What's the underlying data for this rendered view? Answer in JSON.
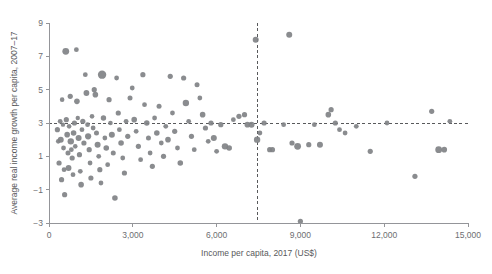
{
  "chart_data": {
    "type": "scatter",
    "title": "",
    "xlabel": "Income per capita, 2017 (US$)",
    "ylabel": "Average real income growth per capita, 2007–17",
    "xlim": [
      0,
      15000
    ],
    "ylim": [
      -3,
      9
    ],
    "xticks": [
      0,
      3000,
      6000,
      9000,
      12000,
      15000
    ],
    "xtick_labels": [
      "0",
      "3,000",
      "6,000",
      "9,000",
      "12,000",
      "15,000"
    ],
    "yticks": [
      -3,
      -1,
      1,
      3,
      5,
      7,
      9
    ],
    "ytick_labels": [
      "−3",
      "−1",
      "1",
      "3",
      "5",
      "7",
      "9"
    ],
    "grid": false,
    "legend": null,
    "point_color": "#808285",
    "reference_lines": [
      {
        "orientation": "horizontal",
        "value": 3,
        "style": "dashed",
        "color": "#58595b"
      },
      {
        "orientation": "vertical",
        "value": 7450,
        "style": "dashed",
        "color": "#58595b"
      }
    ],
    "marker_sizes_vary": true,
    "points": [
      {
        "x": 300,
        "y": 2.6,
        "r": 2.6
      },
      {
        "x": 330,
        "y": 1.9,
        "r": 2.3
      },
      {
        "x": 360,
        "y": 0.6,
        "r": 2.6
      },
      {
        "x": 400,
        "y": 3.1,
        "r": 2.4
      },
      {
        "x": 420,
        "y": 2.0,
        "r": 3.0
      },
      {
        "x": 450,
        "y": -0.4,
        "r": 2.6
      },
      {
        "x": 470,
        "y": 4.4,
        "r": 2.3
      },
      {
        "x": 500,
        "y": 2.9,
        "r": 2.2
      },
      {
        "x": 520,
        "y": 1.5,
        "r": 2.4
      },
      {
        "x": 540,
        "y": 0.2,
        "r": 2.4
      },
      {
        "x": 560,
        "y": -1.3,
        "r": 2.6
      },
      {
        "x": 600,
        "y": 7.3,
        "r": 3.4
      },
      {
        "x": 620,
        "y": 3.2,
        "r": 2.6
      },
      {
        "x": 650,
        "y": 2.3,
        "r": 2.8
      },
      {
        "x": 680,
        "y": 1.2,
        "r": 2.5
      },
      {
        "x": 700,
        "y": 0.3,
        "r": 2.9
      },
      {
        "x": 720,
        "y": 2.8,
        "r": 2.3
      },
      {
        "x": 760,
        "y": 4.6,
        "r": 2.6
      },
      {
        "x": 780,
        "y": 1.9,
        "r": 3.2
      },
      {
        "x": 800,
        "y": 1.4,
        "r": 2.4
      },
      {
        "x": 830,
        "y": 0.9,
        "r": 2.6
      },
      {
        "x": 860,
        "y": -0.1,
        "r": 2.4
      },
      {
        "x": 880,
        "y": 2.4,
        "r": 2.8
      },
      {
        "x": 910,
        "y": 3.0,
        "r": 2.6
      },
      {
        "x": 940,
        "y": 1.6,
        "r": 2.3
      },
      {
        "x": 980,
        "y": 7.4,
        "r": 2.4
      },
      {
        "x": 1000,
        "y": 4.3,
        "r": 2.8
      },
      {
        "x": 1030,
        "y": 3.3,
        "r": 2.2
      },
      {
        "x": 1060,
        "y": 2.1,
        "r": 3.0
      },
      {
        "x": 1090,
        "y": 1.1,
        "r": 2.6
      },
      {
        "x": 1120,
        "y": 0.1,
        "r": 2.4
      },
      {
        "x": 1150,
        "y": -0.7,
        "r": 2.8
      },
      {
        "x": 1180,
        "y": 2.6,
        "r": 2.4
      },
      {
        "x": 1210,
        "y": 3.1,
        "r": 2.6
      },
      {
        "x": 1250,
        "y": 1.8,
        "r": 2.6
      },
      {
        "x": 1300,
        "y": 5.9,
        "r": 2.4
      },
      {
        "x": 1340,
        "y": 4.8,
        "r": 2.9
      },
      {
        "x": 1380,
        "y": 2.9,
        "r": 2.4
      },
      {
        "x": 1400,
        "y": 2.2,
        "r": 3.1
      },
      {
        "x": 1440,
        "y": 1.4,
        "r": 2.6
      },
      {
        "x": 1470,
        "y": 0.6,
        "r": 2.4
      },
      {
        "x": 1500,
        "y": -0.3,
        "r": 2.6
      },
      {
        "x": 1540,
        "y": 3.4,
        "r": 2.3
      },
      {
        "x": 1580,
        "y": 2.7,
        "r": 2.4
      },
      {
        "x": 1620,
        "y": 5.0,
        "r": 2.6
      },
      {
        "x": 1660,
        "y": 4.7,
        "r": 2.8
      },
      {
        "x": 1700,
        "y": 2.4,
        "r": 2.5
      },
      {
        "x": 1740,
        "y": 1.7,
        "r": 3.0
      },
      {
        "x": 1780,
        "y": 1.0,
        "r": 2.4
      },
      {
        "x": 1820,
        "y": 0.2,
        "r": 2.6
      },
      {
        "x": 1860,
        "y": -0.6,
        "r": 2.4
      },
      {
        "x": 1900,
        "y": 5.9,
        "r": 4.2
      },
      {
        "x": 1950,
        "y": 3.3,
        "r": 2.7
      },
      {
        "x": 2000,
        "y": 2.1,
        "r": 2.4
      },
      {
        "x": 2050,
        "y": 1.5,
        "r": 2.8
      },
      {
        "x": 2100,
        "y": 0.5,
        "r": 2.4
      },
      {
        "x": 2150,
        "y": 4.4,
        "r": 2.6
      },
      {
        "x": 2200,
        "y": 3.0,
        "r": 2.3
      },
      {
        "x": 2250,
        "y": 2.3,
        "r": 3.0
      },
      {
        "x": 2300,
        "y": 1.2,
        "r": 2.5
      },
      {
        "x": 2360,
        "y": -1.5,
        "r": 2.8
      },
      {
        "x": 2420,
        "y": 5.7,
        "r": 2.4
      },
      {
        "x": 2480,
        "y": 3.6,
        "r": 2.6
      },
      {
        "x": 2520,
        "y": 2.6,
        "r": 2.4
      },
      {
        "x": 2580,
        "y": 1.8,
        "r": 2.8
      },
      {
        "x": 2640,
        "y": 0.9,
        "r": 2.4
      },
      {
        "x": 2700,
        "y": 0.0,
        "r": 2.6
      },
      {
        "x": 2760,
        "y": 3.1,
        "r": 2.4
      },
      {
        "x": 2820,
        "y": 2.2,
        "r": 2.6
      },
      {
        "x": 2900,
        "y": 4.5,
        "r": 2.5
      },
      {
        "x": 2980,
        "y": 5.1,
        "r": 2.4
      },
      {
        "x": 3050,
        "y": 3.2,
        "r": 2.8
      },
      {
        "x": 3120,
        "y": 2.5,
        "r": 2.4
      },
      {
        "x": 3200,
        "y": 1.6,
        "r": 2.6
      },
      {
        "x": 3280,
        "y": 0.8,
        "r": 2.4
      },
      {
        "x": 3360,
        "y": 5.9,
        "r": 2.6
      },
      {
        "x": 3420,
        "y": 4.1,
        "r": 2.4
      },
      {
        "x": 3500,
        "y": 3.0,
        "r": 2.8
      },
      {
        "x": 3560,
        "y": 2.1,
        "r": 2.5
      },
      {
        "x": 3620,
        "y": 1.2,
        "r": 2.4
      },
      {
        "x": 3700,
        "y": 0.4,
        "r": 2.6
      },
      {
        "x": 3780,
        "y": 3.3,
        "r": 2.4
      },
      {
        "x": 3860,
        "y": 2.4,
        "r": 2.8
      },
      {
        "x": 3940,
        "y": 4.0,
        "r": 2.5
      },
      {
        "x": 4020,
        "y": 1.8,
        "r": 2.4
      },
      {
        "x": 4100,
        "y": 1.0,
        "r": 2.6
      },
      {
        "x": 4180,
        "y": 2.8,
        "r": 2.4
      },
      {
        "x": 4260,
        "y": 2.0,
        "r": 2.8
      },
      {
        "x": 4340,
        "y": 5.8,
        "r": 2.6
      },
      {
        "x": 4420,
        "y": 3.6,
        "r": 2.4
      },
      {
        "x": 4500,
        "y": 2.5,
        "r": 2.6
      },
      {
        "x": 4600,
        "y": 1.5,
        "r": 2.4
      },
      {
        "x": 4700,
        "y": 0.6,
        "r": 2.8
      },
      {
        "x": 4820,
        "y": 5.7,
        "r": 2.6
      },
      {
        "x": 4900,
        "y": 4.2,
        "r": 3.2
      },
      {
        "x": 5000,
        "y": 3.1,
        "r": 2.4
      },
      {
        "x": 5100,
        "y": 2.2,
        "r": 2.6
      },
      {
        "x": 5200,
        "y": 1.4,
        "r": 2.4
      },
      {
        "x": 5300,
        "y": 5.3,
        "r": 2.5
      },
      {
        "x": 5400,
        "y": 4.5,
        "r": 2.4
      },
      {
        "x": 5500,
        "y": 3.5,
        "r": 2.8
      },
      {
        "x": 5600,
        "y": 2.7,
        "r": 2.6
      },
      {
        "x": 5700,
        "y": 1.9,
        "r": 2.4
      },
      {
        "x": 5800,
        "y": 3.0,
        "r": 2.6
      },
      {
        "x": 5900,
        "y": 2.1,
        "r": 3.0
      },
      {
        "x": 6000,
        "y": 1.3,
        "r": 2.4
      },
      {
        "x": 6150,
        "y": 2.9,
        "r": 2.6
      },
      {
        "x": 6300,
        "y": 1.6,
        "r": 3.2
      },
      {
        "x": 6450,
        "y": 1.5,
        "r": 2.8
      },
      {
        "x": 6600,
        "y": 3.2,
        "r": 2.4
      },
      {
        "x": 6800,
        "y": 3.4,
        "r": 2.6
      },
      {
        "x": 7000,
        "y": 3.5,
        "r": 2.6
      },
      {
        "x": 7100,
        "y": 2.9,
        "r": 2.8
      },
      {
        "x": 7250,
        "y": 2.9,
        "r": 3.0
      },
      {
        "x": 7400,
        "y": 8.0,
        "r": 3.0
      },
      {
        "x": 7450,
        "y": 2.0,
        "r": 3.2
      },
      {
        "x": 7550,
        "y": 2.4,
        "r": 2.4
      },
      {
        "x": 7700,
        "y": 3.0,
        "r": 2.6
      },
      {
        "x": 7900,
        "y": 1.4,
        "r": 2.6
      },
      {
        "x": 8000,
        "y": 1.4,
        "r": 2.6
      },
      {
        "x": 8400,
        "y": 2.9,
        "r": 2.4
      },
      {
        "x": 8600,
        "y": 8.3,
        "r": 3.0
      },
      {
        "x": 8700,
        "y": 1.8,
        "r": 2.6
      },
      {
        "x": 8900,
        "y": 1.6,
        "r": 3.4
      },
      {
        "x": 9000,
        "y": -2.9,
        "r": 2.6
      },
      {
        "x": 9300,
        "y": 1.7,
        "r": 2.6
      },
      {
        "x": 9500,
        "y": 2.9,
        "r": 2.4
      },
      {
        "x": 9700,
        "y": 1.7,
        "r": 3.0
      },
      {
        "x": 10000,
        "y": 3.5,
        "r": 2.8
      },
      {
        "x": 10100,
        "y": 3.8,
        "r": 2.6
      },
      {
        "x": 10250,
        "y": 3.0,
        "r": 2.6
      },
      {
        "x": 10400,
        "y": 2.6,
        "r": 2.4
      },
      {
        "x": 10600,
        "y": 2.4,
        "r": 2.4
      },
      {
        "x": 11000,
        "y": 2.8,
        "r": 2.4
      },
      {
        "x": 11500,
        "y": 1.3,
        "r": 2.6
      },
      {
        "x": 12100,
        "y": 3.0,
        "r": 2.4
      },
      {
        "x": 13100,
        "y": -0.2,
        "r": 2.6
      },
      {
        "x": 13700,
        "y": 3.7,
        "r": 2.6
      },
      {
        "x": 13950,
        "y": 1.4,
        "r": 3.4
      },
      {
        "x": 14150,
        "y": 1.4,
        "r": 2.8
      },
      {
        "x": 14350,
        "y": 3.1,
        "r": 2.4
      }
    ]
  }
}
